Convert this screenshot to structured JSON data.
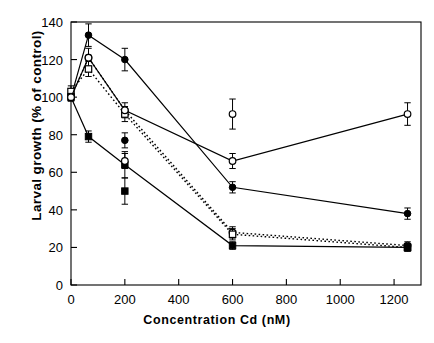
{
  "chart_data": {
    "type": "line",
    "title": "",
    "xlabel": "Concentration Cd (nM)",
    "ylabel": "Larval growth (% of control)",
    "xlim": [
      0,
      1300
    ],
    "ylim": [
      0,
      140
    ],
    "xticks": [
      0,
      200,
      400,
      600,
      800,
      1000,
      1200
    ],
    "yticks": [
      0,
      20,
      40,
      60,
      80,
      100,
      120,
      140
    ],
    "grid": false,
    "legend": "none",
    "x": [
      0,
      65,
      200,
      600,
      1250
    ],
    "series": [
      {
        "name": "filled-circle-solid",
        "marker": "filled-circle",
        "line": "solid",
        "values": [
          100,
          133,
          120,
          52,
          38
        ],
        "errors": [
          2,
          6,
          6,
          3,
          3
        ]
      },
      {
        "name": "open-circle-dotted",
        "marker": "open-circle",
        "line": "dotted",
        "values": [
          100,
          121,
          93,
          28,
          21
        ],
        "errors": [
          2,
          5,
          4,
          3,
          2
        ]
      },
      {
        "name": "open-square-dotted",
        "marker": "open-square",
        "line": "dotted",
        "values": [
          103,
          115,
          91,
          27,
          20
        ],
        "errors": [
          3,
          4,
          4,
          3,
          2
        ]
      },
      {
        "name": "filled-square-solid",
        "marker": "filled-square",
        "line": "solid",
        "values": [
          100,
          79,
          64,
          21,
          20
        ],
        "errors": [
          2,
          3,
          7,
          2,
          2
        ]
      },
      {
        "name": "open-circle-mid-solid",
        "marker": "open-circle",
        "line": "solid",
        "values": [
          100,
          121,
          93,
          66,
          91
        ],
        "errors": [
          0,
          0,
          0,
          4,
          6
        ]
      }
    ],
    "extra_points": [
      {
        "name": "open-circle-600-high",
        "x": 600,
        "y": 91,
        "error": 8
      },
      {
        "name": "open-circle-200-mid",
        "x": 200,
        "y": 66,
        "error": 4
      },
      {
        "name": "filled-circle-200-low",
        "x": 200,
        "y": 77,
        "error": 4
      },
      {
        "name": "filled-square-200-low",
        "x": 200,
        "y": 50,
        "error": 7
      }
    ]
  }
}
